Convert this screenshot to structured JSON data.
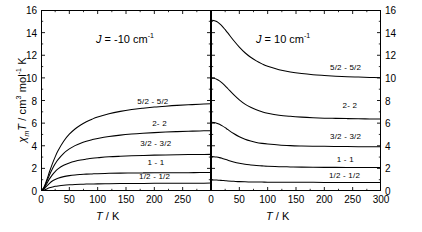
{
  "figure": {
    "axis_titles": {
      "y_chi": "χ",
      "y_sub": "m",
      "y_T": "T",
      "y_rest": " / cm",
      "y_sup3": "3",
      "y_mol": " mol",
      "y_supm1": "-1",
      "y_K": " K",
      "x_T": "T",
      "x_unit": " / K"
    }
  },
  "chart_data": [
    {
      "type": "line",
      "panel": "left",
      "title": "J = -10 cm-1",
      "annotation_J_symbol": "J",
      "annotation_J_value": " = -10 cm",
      "annotation_J_sup": "-1",
      "xlabel": "T / K",
      "ylabel": "χm T / cm3 mol-1 K",
      "xlim": [
        0,
        300
      ],
      "ylim": [
        0,
        16
      ],
      "xticks": [
        0,
        50,
        100,
        150,
        200,
        250
      ],
      "xtick_labels": [
        "0",
        "50",
        "100",
        "150",
        "200",
        "250"
      ],
      "yticks": [
        0,
        2,
        4,
        6,
        8,
        10,
        12,
        14,
        16
      ],
      "ytick_labels": [
        "0",
        "2",
        "4",
        "6",
        "8",
        "10",
        "12",
        "14",
        "16"
      ],
      "yticks_side": "left",
      "grid": false,
      "legend": "inline-curve-labels",
      "x": [
        0,
        5,
        10,
        15,
        20,
        25,
        30,
        40,
        50,
        60,
        70,
        80,
        90,
        100,
        120,
        140,
        160,
        180,
        200,
        220,
        240,
        260,
        280,
        300
      ],
      "series": [
        {
          "name": "5/2 - 5/2",
          "label": "5/2 - 5/2",
          "label_x": 225,
          "label_y": 8.0,
          "values": [
            0,
            0.3,
            0.95,
            1.7,
            2.4,
            3.02,
            3.56,
            4.4,
            5.02,
            5.48,
            5.84,
            6.12,
            6.35,
            6.54,
            6.83,
            7.04,
            7.2,
            7.32,
            7.42,
            7.5,
            7.57,
            7.62,
            7.67,
            7.71
          ]
        },
        {
          "name": "2 - 2",
          "label": "2- 2",
          "label_x": 222,
          "label_y": 6.0,
          "values": [
            0,
            0.26,
            0.82,
            1.42,
            1.95,
            2.4,
            2.77,
            3.33,
            3.72,
            4.01,
            4.23,
            4.4,
            4.54,
            4.65,
            4.82,
            4.94,
            5.03,
            5.1,
            5.16,
            5.21,
            5.25,
            5.28,
            5.31,
            5.33
          ]
        },
        {
          "name": "3/2 - 3/2",
          "label": "3/2 - 3/2",
          "label_x": 230,
          "label_y": 4.2,
          "values": [
            0,
            0.21,
            0.64,
            1.07,
            1.43,
            1.72,
            1.95,
            2.27,
            2.48,
            2.63,
            2.74,
            2.82,
            2.89,
            2.94,
            3.02,
            3.07,
            3.11,
            3.14,
            3.17,
            3.19,
            3.2,
            3.22,
            3.23,
            3.24
          ]
        },
        {
          "name": "1 - 1",
          "label": "1 - 1",
          "label_x": 218,
          "label_y": 2.6,
          "values": [
            0,
            0.15,
            0.43,
            0.68,
            0.88,
            1.02,
            1.13,
            1.27,
            1.36,
            1.42,
            1.46,
            1.49,
            1.51,
            1.53,
            1.56,
            1.58,
            1.59,
            1.6,
            1.61,
            1.61,
            1.62,
            1.62,
            1.63,
            1.63
          ]
        },
        {
          "name": "1/2 - 1/2",
          "label": "1/2 - 1/2",
          "label_x": 228,
          "label_y": 1.35,
          "values": [
            0,
            0.07,
            0.18,
            0.28,
            0.35,
            0.41,
            0.45,
            0.51,
            0.55,
            0.58,
            0.6,
            0.61,
            0.62,
            0.63,
            0.65,
            0.66,
            0.67,
            0.67,
            0.68,
            0.68,
            0.69,
            0.69,
            0.69,
            0.7
          ]
        }
      ]
    },
    {
      "type": "line",
      "panel": "right",
      "title": "J = 10 cm-1",
      "annotation_J_symbol": "J",
      "annotation_J_value": " = 10 cm",
      "annotation_J_sup": "-1",
      "xlabel": "T / K",
      "ylabel": "χm T / cm3 mol-1 K",
      "xlim": [
        0,
        300
      ],
      "ylim": [
        0,
        16
      ],
      "xticks": [
        0,
        50,
        100,
        150,
        200,
        250,
        300
      ],
      "xtick_labels": [
        "0",
        "50",
        "100",
        "150",
        "200",
        "250",
        "300"
      ],
      "yticks": [
        0,
        2,
        4,
        6,
        8,
        10,
        12,
        14,
        16
      ],
      "ytick_labels": [
        "0",
        "2",
        "4",
        "6",
        "8",
        "10",
        "12",
        "14",
        "16"
      ],
      "yticks_side": "right",
      "grid": false,
      "legend": "inline-curve-labels",
      "x": [
        0,
        5,
        10,
        15,
        20,
        25,
        30,
        40,
        50,
        60,
        70,
        80,
        90,
        100,
        120,
        140,
        160,
        180,
        200,
        220,
        240,
        260,
        280,
        300
      ],
      "series": [
        {
          "name": "5/2 - 5/2",
          "label": "5/2 - 5/2",
          "label_x": 265,
          "label_y": 11.0,
          "values": [
            15.1,
            15.08,
            14.98,
            14.8,
            14.56,
            14.26,
            13.95,
            13.3,
            12.72,
            12.22,
            11.82,
            11.5,
            11.24,
            11.02,
            10.72,
            10.52,
            10.38,
            10.28,
            10.21,
            10.15,
            10.1,
            10.07,
            10.04,
            10.01
          ]
        },
        {
          "name": "2 - 2",
          "label": "2- 2",
          "label_x": 258,
          "label_y": 7.6,
          "values": [
            9.98,
            9.96,
            9.88,
            9.74,
            9.54,
            9.3,
            9.04,
            8.52,
            8.06,
            7.68,
            7.4,
            7.18,
            7.01,
            6.88,
            6.7,
            6.6,
            6.53,
            6.48,
            6.44,
            6.42,
            6.4,
            6.38,
            6.37,
            6.36
          ]
        },
        {
          "name": "3/2 - 3/2",
          "label": "3/2 - 3/2",
          "label_x": 265,
          "label_y": 4.85,
          "values": [
            6.08,
            6.06,
            6.0,
            5.9,
            5.76,
            5.6,
            5.42,
            5.08,
            4.79,
            4.57,
            4.41,
            4.29,
            4.21,
            4.15,
            4.06,
            4.01,
            3.98,
            3.96,
            3.95,
            3.94,
            3.93,
            3.92,
            3.92,
            3.91
          ]
        },
        {
          "name": "1 - 1",
          "label": "1 - 1",
          "label_x": 252,
          "label_y": 2.85,
          "values": [
            3.04,
            3.03,
            3.0,
            2.95,
            2.88,
            2.8,
            2.72,
            2.57,
            2.45,
            2.36,
            2.3,
            2.25,
            2.22,
            2.19,
            2.15,
            2.13,
            2.11,
            2.1,
            2.09,
            2.09,
            2.08,
            2.08,
            2.08,
            2.07
          ]
        },
        {
          "name": "1/2 - 1/2",
          "label": "1/2 - 1/2",
          "label_x": 263,
          "label_y": 1.45,
          "values": [
            0.98,
            0.98,
            0.97,
            0.95,
            0.93,
            0.91,
            0.89,
            0.86,
            0.83,
            0.81,
            0.8,
            0.79,
            0.79,
            0.78,
            0.78,
            0.77,
            0.77,
            0.77,
            0.76,
            0.76,
            0.76,
            0.76,
            0.76,
            0.76
          ]
        }
      ]
    }
  ]
}
